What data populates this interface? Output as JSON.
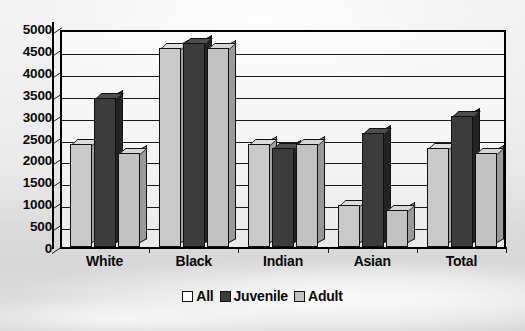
{
  "chart_data": {
    "type": "bar",
    "title": "",
    "subtitle": "",
    "xlabel": "",
    "ylabel": "",
    "categories": [
      "White",
      "Black",
      "Indian",
      "Asian",
      "Total"
    ],
    "series": [
      {
        "name": "All",
        "values": [
          2350,
          4550,
          2350,
          950,
          2250
        ],
        "color": "#c9c9c9"
      },
      {
        "name": "Juvenile",
        "values": [
          3400,
          4650,
          2250,
          2600,
          3000
        ],
        "color": "#3c3c3c"
      },
      {
        "name": "Adult",
        "values": [
          2150,
          4550,
          2350,
          850,
          2150
        ],
        "color": "#c2c2c2"
      }
    ],
    "ylim": [
      0,
      5000
    ],
    "ytick_step": 500,
    "yticks": [
      5000,
      4500,
      4000,
      3500,
      3000,
      2500,
      2000,
      1500,
      1000,
      500,
      0
    ],
    "ytick_labels": [
      "5000",
      "4500",
      "4000",
      "3500",
      "3000",
      "2500",
      "2000",
      "1500",
      "1000",
      "500",
      "0"
    ],
    "grid": true,
    "legend_position": "bottom",
    "style": "3d-column",
    "background": "grayscale-photo"
  },
  "legend": {
    "items": [
      {
        "label": "All",
        "swatch": "#ffffff"
      },
      {
        "label": "Juvenile",
        "swatch": "#3c3c3c"
      },
      {
        "label": "Adult",
        "swatch": "#c2c2c2"
      }
    ]
  }
}
